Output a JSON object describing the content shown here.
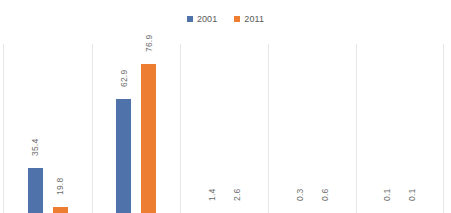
{
  "chart_data": {
    "type": "bar",
    "title": "",
    "xlabel": "",
    "ylabel": "",
    "grid": "vertical-category-separators",
    "legend_position": "top-center",
    "ylim": [
      0,
      85
    ],
    "categories": [
      "1",
      "2",
      "3",
      "4",
      "5"
    ],
    "series": [
      {
        "name": "2001",
        "color": "#4f72ab",
        "values": [
          35.4,
          62.9,
          1.4,
          0.3,
          0.1
        ]
      },
      {
        "name": "2011",
        "color": "#ed7d31",
        "values": [
          19.8,
          76.9,
          2.6,
          0.6,
          0.1
        ]
      }
    ],
    "data_labels": [
      [
        "35.4",
        "19.8"
      ],
      [
        "62.9",
        "76.9"
      ],
      [
        "1.4",
        "2.6"
      ],
      [
        "0.3",
        "0.6"
      ],
      [
        "0.1",
        "0.1"
      ]
    ]
  },
  "legend": {
    "items": [
      {
        "label": "2001",
        "color": "#4f72ab"
      },
      {
        "label": "2011",
        "color": "#ed7d31"
      }
    ]
  },
  "colors": {
    "series_2001": "#4f72ab",
    "series_2011": "#ed7d31",
    "gridline": "#e8e8ea",
    "label_text": "#6d6d6d",
    "background": "#ffffff"
  }
}
